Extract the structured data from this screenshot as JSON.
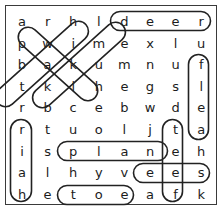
{
  "puzzle": {
    "type": "word-search",
    "columns": 8,
    "rows": 9,
    "border_color": "#3a3a3a",
    "letter_color": "#1c1c1c",
    "mark_color": "#222222",
    "grid": [
      [
        "a",
        "r",
        "h",
        "l",
        "d",
        "e",
        "e",
        "r"
      ],
      [
        "p",
        "w",
        "i",
        "m",
        "e",
        "x",
        "l",
        "u"
      ],
      [
        "b",
        "a",
        "k",
        "u",
        "m",
        "n",
        "u",
        "f"
      ],
      [
        "t",
        "k",
        "l",
        "h",
        "e",
        "g",
        "s",
        "l"
      ],
      [
        "r",
        "b",
        "c",
        "e",
        "b",
        "w",
        "d",
        "e"
      ],
      [
        "r",
        "t",
        "u",
        "o",
        "l",
        "j",
        "t",
        "a"
      ],
      [
        "i",
        "s",
        "p",
        "l",
        "a",
        "n",
        "e",
        "h"
      ],
      [
        "a",
        "l",
        "h",
        "y",
        "v",
        "e",
        "e",
        "s"
      ],
      [
        "h",
        "e",
        "t",
        "o",
        "e",
        "a",
        "f",
        "k"
      ]
    ],
    "found_words": [
      {
        "word": "deer",
        "orientation": "horizontal",
        "start_row": 0,
        "start_col": 4,
        "end_row": 0,
        "end_col": 7,
        "letters": "d e e r"
      },
      {
        "word": "black",
        "orientation": "diagonal-up-right",
        "start_row": 4,
        "start_col": 1,
        "end_row": 0,
        "end_col": 3,
        "letters": "b k a i l"
      },
      {
        "word": "pale",
        "orientation": "diagonal-down-right",
        "start_row": 1,
        "start_col": 0,
        "end_row": 4,
        "end_col": 3,
        "letters": "p a l e"
      },
      {
        "word": "take",
        "orientation": "diagonal-up-right",
        "start_row": 3,
        "start_col": 0,
        "end_row": 1,
        "end_col": 4,
        "letters": "t a k e"
      },
      {
        "word": "flea",
        "orientation": "vertical",
        "start_row": 2,
        "start_col": 7,
        "end_row": 5,
        "end_col": 7,
        "letters": "f l e a"
      },
      {
        "word": "hair",
        "orientation": "vertical-reversed",
        "start_row": 5,
        "start_col": 0,
        "end_row": 8,
        "end_col": 0,
        "letters": "r i a h"
      },
      {
        "word": "feet",
        "orientation": "vertical-reversed",
        "start_row": 5,
        "start_col": 6,
        "end_row": 8,
        "end_col": 6,
        "letters": "t e e f"
      },
      {
        "word": "plane",
        "orientation": "horizontal",
        "start_row": 6,
        "start_col": 2,
        "end_row": 6,
        "end_col": 6,
        "letters": "p l a n e"
      },
      {
        "word": "ees",
        "orientation": "horizontal",
        "start_row": 7,
        "start_col": 5,
        "end_row": 7,
        "end_col": 7,
        "letters": "e e s"
      },
      {
        "word": "toe",
        "orientation": "horizontal",
        "start_row": 8,
        "start_col": 2,
        "end_row": 8,
        "end_col": 4,
        "letters": "t o e"
      }
    ]
  }
}
